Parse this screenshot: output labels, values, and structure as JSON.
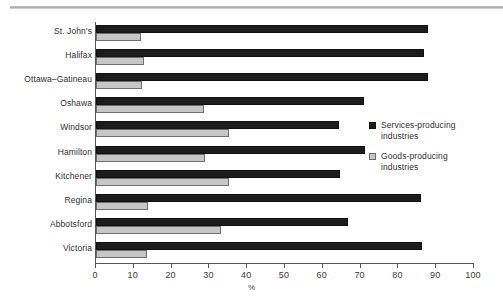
{
  "chart_data": {
    "type": "bar",
    "orientation": "horizontal",
    "title": "",
    "xlabel": "%",
    "ylabel": "",
    "xlim": [
      0,
      100
    ],
    "xticks": [
      0,
      10,
      20,
      30,
      40,
      50,
      60,
      70,
      80,
      90,
      100
    ],
    "xtick_labels": [
      "0",
      "10",
      "20",
      "30",
      "40",
      "50",
      "60",
      "70",
      "80",
      "90",
      "100"
    ],
    "grid": false,
    "legend_position": "right-middle",
    "categories": [
      "St. John's",
      "Halifax",
      "Ottawa–Gatineau",
      "Oshawa",
      "Windsor",
      "Hamilton",
      "Kitchener",
      "Regina",
      "Abbotsford",
      "Victoria"
    ],
    "series": [
      {
        "name": "Services-producing industries",
        "color": "#1c1c1c",
        "values": [
          87.8,
          86.8,
          87.7,
          71.0,
          64.4,
          71.1,
          64.5,
          86.0,
          66.6,
          86.2
        ]
      },
      {
        "name": "Goods-producing industries",
        "color": "#c6c6c6",
        "values": [
          12.0,
          12.8,
          12.2,
          28.7,
          35.2,
          28.8,
          35.1,
          13.8,
          33.0,
          13.5
        ]
      }
    ]
  },
  "legend": {
    "entries": [
      {
        "label_line1": "Services-producing",
        "label_line2": "industries",
        "swatch": "dark-square-icon"
      },
      {
        "label_line1": "Goods-producing",
        "label_line2": "industries",
        "swatch": "light-square-icon"
      }
    ]
  },
  "axis": {
    "x_title": "%"
  }
}
